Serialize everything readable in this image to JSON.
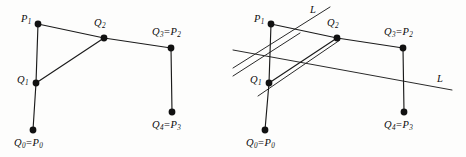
{
  "figure": {
    "background_color": "#fdfdfc",
    "line_color": "#1b1b1b",
    "vertex_color": "#111111",
    "transversal_color": "#2a2a2a",
    "panels": [
      {
        "name": "left-panel",
        "caption": "",
        "vertices": [
          {
            "id": "P1",
            "label_main": "P",
            "label_sub": "1",
            "alias": "",
            "alias_sub": "",
            "x": 38,
            "y": 24,
            "label_x": 21,
            "label_y": 14
          },
          {
            "id": "Q2",
            "label_main": "Q",
            "label_sub": "2",
            "alias": "",
            "alias_sub": "",
            "x": 104,
            "y": 38,
            "label_x": 94,
            "label_y": 18
          },
          {
            "id": "Q3",
            "label_main": "Q",
            "label_sub": "3",
            "alias": "P",
            "alias_sub": "2",
            "x": 171,
            "y": 48,
            "label_x": 152,
            "label_y": 27
          },
          {
            "id": "Q1",
            "label_main": "Q",
            "label_sub": "1",
            "alias": "",
            "alias_sub": "",
            "x": 36,
            "y": 83,
            "label_x": 17,
            "label_y": 75
          },
          {
            "id": "Q4",
            "label_main": "Q",
            "label_sub": "4",
            "alias": "P",
            "alias_sub": "3",
            "x": 172,
            "y": 112,
            "label_x": 152,
            "label_y": 120
          },
          {
            "id": "Q0",
            "label_main": "Q",
            "label_sub": "0",
            "alias": "P",
            "alias_sub": "0",
            "x": 33,
            "y": 130,
            "label_x": 14,
            "label_y": 138
          }
        ],
        "edges": [
          {
            "from": "P1",
            "to": "Q2"
          },
          {
            "from": "Q2",
            "to": "Q3"
          },
          {
            "from": "Q2",
            "to": "Q1"
          },
          {
            "from": "P1",
            "to": "Q1"
          },
          {
            "from": "Q1",
            "to": "Q0"
          },
          {
            "from": "Q3",
            "to": "Q4"
          }
        ],
        "transversals": []
      },
      {
        "name": "right-panel",
        "caption": "",
        "vertices": [
          {
            "id": "P1",
            "label_main": "P",
            "label_sub": "1",
            "alias": "",
            "alias_sub": "",
            "x": 271,
            "y": 24,
            "label_x": 254,
            "label_y": 14
          },
          {
            "id": "Q2",
            "label_main": "Q",
            "label_sub": "2",
            "alias": "",
            "alias_sub": "",
            "x": 337,
            "y": 38,
            "label_x": 327,
            "label_y": 18
          },
          {
            "id": "Q3",
            "label_main": "Q",
            "label_sub": "3",
            "alias": "P",
            "alias_sub": "2",
            "x": 403,
            "y": 48,
            "label_x": 384,
            "label_y": 27
          },
          {
            "id": "Q1",
            "label_main": "Q",
            "label_sub": "1",
            "alias": "",
            "alias_sub": "",
            "x": 269,
            "y": 83,
            "label_x": 250,
            "label_y": 75
          },
          {
            "id": "Q4",
            "label_main": "Q",
            "label_sub": "4",
            "alias": "P",
            "alias_sub": "3",
            "x": 404,
            "y": 112,
            "label_x": 384,
            "label_y": 120
          },
          {
            "id": "Q0",
            "label_main": "Q",
            "label_sub": "0",
            "alias": "P",
            "alias_sub": "0",
            "x": 265,
            "y": 130,
            "label_x": 246,
            "label_y": 138
          }
        ],
        "edges": [
          {
            "from": "P1",
            "to": "Q2"
          },
          {
            "from": "Q2",
            "to": "Q3"
          },
          {
            "from": "Q2",
            "to": "Q1"
          },
          {
            "from": "P1",
            "to": "Q1"
          },
          {
            "from": "Q1",
            "to": "Q0"
          },
          {
            "from": "Q3",
            "to": "Q4"
          }
        ],
        "transversals": [
          {
            "name": "line-L-upper",
            "label": "L",
            "x1": 233,
            "y1": 68,
            "x2": 330,
            "y2": 7,
            "label_x": 310,
            "label_y": 5
          },
          {
            "name": "line-L-lower",
            "label": "L",
            "x1": 233,
            "y1": 50,
            "x2": 300,
            "y2": 78,
            "label_x": 0,
            "label_y": 0,
            "hide_label": true
          },
          {
            "name": "line-L-long",
            "label": "L",
            "x1": 233,
            "y1": 50,
            "x2": 452,
            "y2": 90,
            "label_x": 437,
            "label_y": 74
          }
        ]
      }
    ]
  }
}
